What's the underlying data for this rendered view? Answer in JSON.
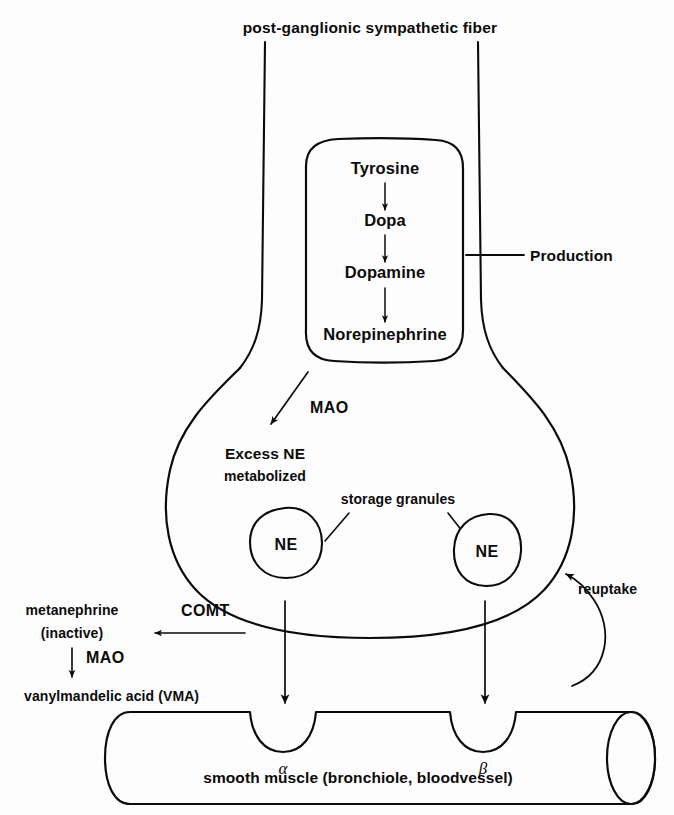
{
  "figure": {
    "title": "post-ganglionic sympathetic fiber",
    "colors": {
      "ink": "#0b0b0b",
      "background": "#fdfdfd"
    }
  },
  "synthesis": {
    "callout_label": "Production",
    "steps": [
      {
        "label": "Tyrosine"
      },
      {
        "label": "Dopa"
      },
      {
        "label": "Dopamine"
      },
      {
        "label": "Norepinephrine"
      }
    ]
  },
  "terminal": {
    "mao_label": "MAO",
    "excess_line1": "Excess NE",
    "excess_line2": "metabolized",
    "granules_label": "storage granules",
    "granules": [
      {
        "label": "NE"
      },
      {
        "label": "NE"
      }
    ],
    "reuptake_label": "reuptake"
  },
  "metabolism": {
    "comt_label": "COMT",
    "mao_label": "MAO",
    "metanephrine_line1": "metanephrine",
    "metanephrine_line2": "(inactive)",
    "vma_label": "vanylmandelic acid (VMA)"
  },
  "effector": {
    "muscle_label": "smooth muscle (bronchiole, bloodvessel)",
    "receptors": [
      {
        "label": "α"
      },
      {
        "label": "β"
      }
    ]
  }
}
